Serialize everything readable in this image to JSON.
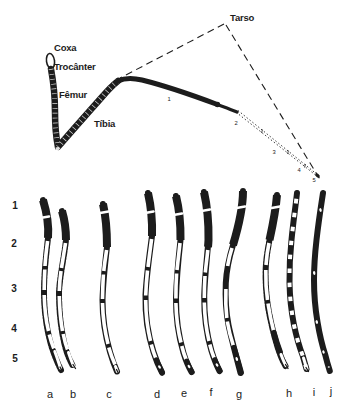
{
  "colors": {
    "ink": "#1c1c1c",
    "background": "#ffffff"
  },
  "schematic": {
    "labels": {
      "coxa": "Coxa",
      "trocanter": "Trocânter",
      "femur": "Fêmur",
      "tibia": "Tíbia",
      "tarso": "Tarso"
    },
    "tarsomere_numbers": [
      "1",
      "2",
      "3",
      "4",
      "5"
    ]
  },
  "comparison": {
    "row_numbers": [
      "1",
      "2",
      "3",
      "4",
      "5"
    ],
    "specimen_letters": [
      "a",
      "b",
      "c",
      "d",
      "e",
      "f",
      "g",
      "h",
      "i",
      "j"
    ]
  }
}
